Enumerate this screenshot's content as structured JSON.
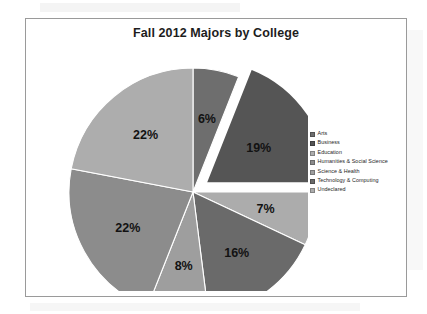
{
  "page": {
    "background_color": "#ffffff",
    "frame_border_color": "#9a9a9a"
  },
  "chart_title": "Fall 2012 Majors by College",
  "legend": {
    "position": "right",
    "items": [
      {
        "label": "Arts",
        "color": "#6e6e6e",
        "swatch_icon": "legend-swatch-icon"
      },
      {
        "label": "Business",
        "color": "#555555",
        "swatch_icon": "legend-swatch-icon"
      },
      {
        "label": "Education",
        "color": "#adadad",
        "swatch_icon": "legend-swatch-icon"
      },
      {
        "label": "Humanities & Social Science",
        "color": "#8c8c8c",
        "swatch_icon": "legend-swatch-icon"
      },
      {
        "label": "Science & Health",
        "color": "#9e9e9e",
        "swatch_icon": "legend-swatch-icon"
      },
      {
        "label": "Technology & Computing",
        "color": "#6a6a6a",
        "swatch_icon": "legend-swatch-icon"
      },
      {
        "label": "Undeclared",
        "color": "#acacac",
        "swatch_icon": "legend-swatch-icon"
      }
    ]
  },
  "chart_data": {
    "type": "pie",
    "title": "Fall 2012 Majors by College",
    "xlabel": "",
    "ylabel": "",
    "legend_position": "right",
    "grid": false,
    "value_unit": "percent",
    "labels_shown_on_slices": true,
    "exploded_slice": "Business",
    "categories": [
      "Arts",
      "Business",
      "Undeclared",
      "Technology & Computing",
      "Science & Health",
      "Humanities & Social Science",
      "Education"
    ],
    "values": [
      6,
      19,
      7,
      16,
      8,
      22,
      22
    ],
    "slices": [
      {
        "label": "Arts",
        "value": 6,
        "display": "6%",
        "color": "#6e6e6e",
        "exploded": false
      },
      {
        "label": "Business",
        "value": 19,
        "display": "19%",
        "color": "#555555",
        "exploded": true
      },
      {
        "label": "Undeclared",
        "value": 7,
        "display": "7%",
        "color": "#acacac",
        "exploded": false
      },
      {
        "label": "Technology & Computing",
        "value": 16,
        "display": "16%",
        "color": "#6a6a6a",
        "exploded": false
      },
      {
        "label": "Science & Health",
        "value": 8,
        "display": "8%",
        "color": "#9e9e9e",
        "exploded": false
      },
      {
        "label": "Humanities & Social Science",
        "value": 22,
        "display": "22%",
        "color": "#8c8c8c",
        "exploded": false
      },
      {
        "label": "Education",
        "value": 22,
        "display": "22%",
        "color": "#adadad",
        "exploded": false
      }
    ],
    "slice_labels": [
      "6%",
      "19%",
      "7%",
      "16%",
      "8%",
      "22%",
      "22%"
    ],
    "total": 100
  }
}
